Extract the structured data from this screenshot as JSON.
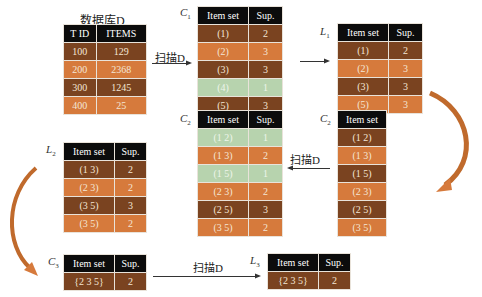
{
  "database": {
    "title": "数据库D",
    "headers": [
      "T ID",
      "ITEMS"
    ],
    "rows": [
      [
        "100",
        "129"
      ],
      [
        "200",
        "2368"
      ],
      [
        "300",
        "1245"
      ],
      [
        "400",
        "25"
      ]
    ]
  },
  "scan_label": "扫描D",
  "tables": {
    "C1": {
      "label": "C",
      "sub": "1",
      "headers": [
        "Item set",
        "Sup."
      ],
      "rows": [
        {
          "set": "(1)",
          "sup": "2",
          "style": "dk"
        },
        {
          "set": "(2)",
          "sup": "3",
          "style": "lt"
        },
        {
          "set": "(3)",
          "sup": "3",
          "style": "dk"
        },
        {
          "set": "(4)",
          "sup": "1",
          "style": "gr"
        },
        {
          "set": "(5)",
          "sup": "3",
          "style": "dk"
        }
      ]
    },
    "L1": {
      "label": "L",
      "sub": "1",
      "headers": [
        "Item set",
        "Sup."
      ],
      "rows": [
        {
          "set": "(1)",
          "sup": "2"
        },
        {
          "set": "(2)",
          "sup": "3"
        },
        {
          "set": "(3)",
          "sup": "3"
        },
        {
          "set": "(5)",
          "sup": "3"
        }
      ]
    },
    "C2_left": {
      "label": "C",
      "sub": "2",
      "headers": [
        "Item set"
      ],
      "rows": [
        "(1 2)",
        "(1 3)",
        "(1 5)",
        "(2 3)",
        "(2 5)",
        "(3 5)"
      ]
    },
    "C2_mid": {
      "label": "C",
      "sub": "2",
      "headers": [
        "Item set",
        "Sup."
      ],
      "rows": [
        {
          "set": "(1 2)",
          "sup": "1",
          "style": "gr"
        },
        {
          "set": "(1 3)",
          "sup": "2",
          "style": "lt"
        },
        {
          "set": "(1 5)",
          "sup": "1",
          "style": "gr"
        },
        {
          "set": "(2 3)",
          "sup": "2",
          "style": "lt"
        },
        {
          "set": "(2 5)",
          "sup": "3",
          "style": "dk"
        },
        {
          "set": "(3 5)",
          "sup": "2",
          "style": "lt"
        }
      ]
    },
    "L2": {
      "label": "L",
      "sub": "2",
      "headers": [
        "Item set",
        "Sup."
      ],
      "rows": [
        {
          "set": "(1 3)",
          "sup": "2"
        },
        {
          "set": "(2 3)",
          "sup": "2"
        },
        {
          "set": "(3 5)",
          "sup": "3"
        },
        {
          "set": "(3 5)",
          "sup": "2"
        }
      ]
    },
    "C3": {
      "label": "C",
      "sub": "3",
      "headers": [
        "Item set",
        "Sup."
      ],
      "rows": [
        {
          "set": "{2 3 5}",
          "sup": "2"
        }
      ]
    },
    "L3": {
      "label": "L",
      "sub": "3",
      "headers": [
        "Item set",
        "Sup."
      ],
      "rows": [
        {
          "set": "{2 3 5}",
          "sup": "2"
        }
      ]
    }
  },
  "colors": {
    "header": "#0c0c0c",
    "dark_row": "#7a4320",
    "light_row": "#d67a3c",
    "pruned_row": "#b7d3ae",
    "curve_arrow": "#c8692a"
  }
}
